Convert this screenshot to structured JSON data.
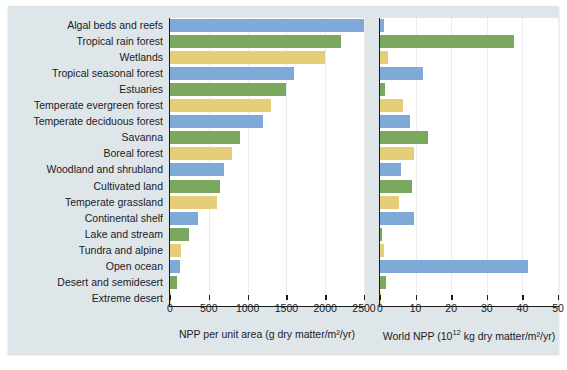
{
  "chart_data": {
    "type": "bar",
    "title": "",
    "grid": true,
    "legend": false,
    "orientation": "horizontal",
    "categories": [
      "Algal beds and reefs",
      "Tropical rain forest",
      "Wetlands",
      "Tropical seasonal forest",
      "Estuaries",
      "Temperate evergreen forest",
      "Temperate deciduous forest",
      "Savanna",
      "Boreal forest",
      "Woodland and shrubland",
      "Cultivated land",
      "Temperate grassland",
      "Continental shelf",
      "Lake and stream",
      "Tundra and alpine",
      "Open ocean",
      "Desert and semidesert",
      "Extreme desert"
    ],
    "bar_colors": [
      "#7fa9d6",
      "#7ba85e",
      "#e5cd7a",
      "#7fa9d6",
      "#7ba85e",
      "#e5cd7a",
      "#7fa9d6",
      "#7ba85e",
      "#e5cd7a",
      "#7fa9d6",
      "#7ba85e",
      "#e5cd7a",
      "#7fa9d6",
      "#7ba85e",
      "#e5cd7a",
      "#7fa9d6",
      "#7ba85e",
      "#e5cd7a"
    ],
    "panels": [
      {
        "id": "npp-per-unit-area",
        "xlabel": "NPP per unit area (g dry matter/m2/yr)",
        "xlabel_plain": "NPP per unit area (g dry matter/m²/yr)",
        "xlim": [
          0,
          2500
        ],
        "ticks": [
          0,
          500,
          1000,
          1500,
          2000,
          2500
        ],
        "ticklabels": [
          "0",
          "500",
          "1000",
          "1500",
          "2000",
          "2500"
        ],
        "values": [
          2500,
          2200,
          2000,
          1600,
          1500,
          1300,
          1200,
          900,
          800,
          700,
          650,
          600,
          360,
          250,
          140,
          125,
          90,
          3
        ]
      },
      {
        "id": "world-npp",
        "xlabel": "World NPP (1012 kg dry matter/m2/yr)",
        "xlabel_prefix": "World NPP (10",
        "xlabel_exponent": "12",
        "xlabel_suffix": " kg dry matter/m²/yr)",
        "xlim": [
          0,
          50
        ],
        "ticks": [
          0,
          10,
          20,
          30,
          40,
          50
        ],
        "ticklabels": [
          "0",
          "10",
          "20",
          "30",
          "40",
          "50"
        ],
        "values": [
          1.1,
          37.5,
          2.3,
          12.0,
          1.3,
          6.5,
          8.5,
          13.5,
          9.5,
          6.0,
          9.1,
          5.4,
          9.6,
          0.5,
          1.1,
          41.5,
          1.6,
          0.07
        ]
      }
    ]
  }
}
